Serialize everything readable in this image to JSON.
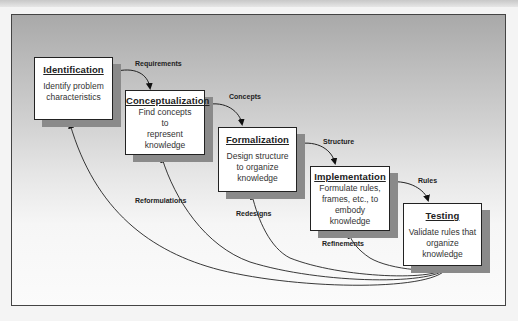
{
  "stages": [
    {
      "id": "identification",
      "title": "Identification",
      "lines": [
        "Identify problem",
        "characteristics"
      ]
    },
    {
      "id": "conceptualization",
      "title": "Conceptualization",
      "lines": [
        "Find concepts",
        "to",
        "represent",
        "knowledge"
      ]
    },
    {
      "id": "formalization",
      "title": "Formalization",
      "lines": [
        "Design structure",
        "to organize",
        "knowledge"
      ]
    },
    {
      "id": "implementation",
      "title": "Implementation",
      "lines": [
        "Formulate rules,",
        "frames, etc., to",
        "embody",
        "knowledge"
      ]
    },
    {
      "id": "testing",
      "title": "Testing",
      "lines": [
        "Validate rules that",
        "organize",
        "knowledge"
      ]
    }
  ],
  "forward_links": [
    "Requirements",
    "Concepts",
    "Structure",
    "Rules"
  ],
  "feedback_links": [
    "Reformulations",
    "Redesigns",
    "Refinements"
  ]
}
